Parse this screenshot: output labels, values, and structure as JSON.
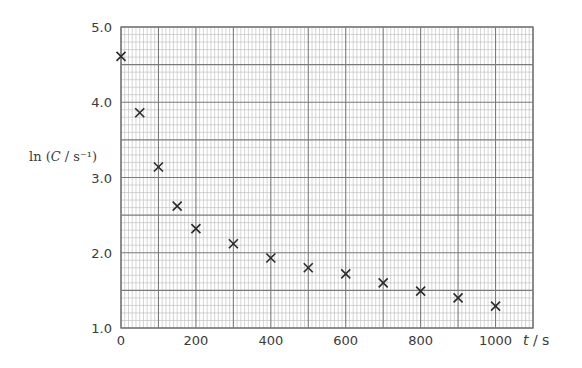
{
  "chart_data": {
    "type": "scatter",
    "title": "",
    "xlabel": "t / s",
    "ylabel": "ln (C / s⁻¹)",
    "xlim": [
      0,
      1100
    ],
    "ylim": [
      1.0,
      5.0
    ],
    "grid": true,
    "legend": null,
    "marker": "x",
    "x_ticks": [
      0,
      200,
      400,
      600,
      800,
      1000
    ],
    "x_tick_labels": [
      "0",
      "200",
      "400",
      "600",
      "800",
      "1000"
    ],
    "y_ticks": [
      1.0,
      2.0,
      3.0,
      4.0,
      5.0
    ],
    "y_tick_labels": [
      "1.0",
      "2.0",
      "3.0",
      "4.0",
      "5.0"
    ],
    "x": [
      0,
      50,
      100,
      150,
      200,
      300,
      400,
      500,
      600,
      700,
      800,
      900,
      1000
    ],
    "y": [
      4.61,
      3.86,
      3.14,
      2.62,
      2.32,
      2.12,
      1.93,
      1.8,
      1.72,
      1.6,
      1.49,
      1.4,
      1.29
    ]
  },
  "axes": {
    "x_label_main": "t",
    "x_label_unit": " / s",
    "y_label_prefix": "ln (",
    "y_label_var": "C",
    "y_label_suffix": " / s⁻¹)"
  },
  "colors": {
    "minor_grid": "#b8b8b8",
    "major_grid": "#7a7a7a",
    "marker": "#2a2a2a",
    "text": "#3a3a3a"
  }
}
